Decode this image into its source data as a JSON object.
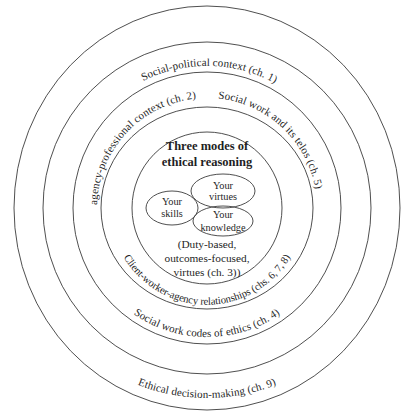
{
  "colors": {
    "stroke": "#3b3b3b",
    "text": "#1f1f1f",
    "background": "#ffffff"
  },
  "title": {
    "line1": "Three modes of",
    "line2": "ethical reasoning"
  },
  "ring_labels": {
    "ch1": "Social-political context (ch. 1)",
    "ch2": "agency-professional context (ch. 2)",
    "ch5": "Social work and its telos (ch. 5)",
    "ch678": "Client-worker-agency relationships (chs. 6, 7, 8)",
    "ch4": "Social work codes of ethics (ch. 4)",
    "ch9": "Ethical decision-making (ch. 9)"
  },
  "venn": {
    "skills": {
      "line1": "Your",
      "line2": "skills"
    },
    "virtues": {
      "line1": "Your",
      "line2": "virtues"
    },
    "knowledge": {
      "line1": "Your",
      "line2": "knowledge"
    }
  },
  "note": {
    "line1": "(Duty-based,",
    "line2": "outcomes-focused,",
    "line3": "virtues (ch. 3))"
  }
}
